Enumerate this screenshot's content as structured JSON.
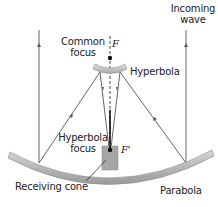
{
  "labels": {
    "incoming_wave_1": "Incoming",
    "incoming_wave_2": "wave",
    "common_focus_1": "Common",
    "common_focus_2": "focus",
    "hyperbola": "Hyperbola",
    "hyperbola_focus_1": "Hyperbola",
    "hyperbola_focus_2": "focus",
    "receiving_cone": "Receiving cone",
    "parabola": "Parabola",
    "focus_F": "F",
    "focus_F_prime": "F'"
  },
  "colors": {
    "rays": "#555555",
    "dish": "#b8b8b8",
    "cone": "#a6a6a6",
    "text": "#222222"
  }
}
